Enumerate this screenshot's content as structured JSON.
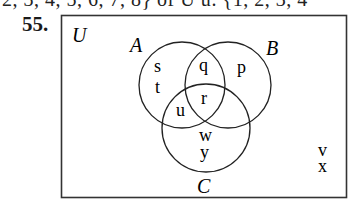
{
  "header": {
    "cropped_line": "2, 3, 4, 5, 6, 7, 8} of U        u: {1, 2, 3, 4",
    "problem_number": "55."
  },
  "diagram": {
    "universe_label": "U",
    "sets": [
      {
        "name": "A",
        "label": "A"
      },
      {
        "name": "B",
        "label": "B"
      },
      {
        "name": "C",
        "label": "C"
      }
    ],
    "regions": {
      "A_only": [
        "s",
        "t"
      ],
      "A_and_B_only": [
        "q"
      ],
      "B_only": [
        "p"
      ],
      "A_and_B_and_C": [
        "r"
      ],
      "A_and_C_only": [
        "u"
      ],
      "C_only": [
        "w",
        "y"
      ],
      "outside": [
        "v",
        "x"
      ]
    },
    "elements": {
      "s": "s",
      "t": "t",
      "q": "q",
      "p": "p",
      "r": "r",
      "u": "u",
      "w": "w",
      "y": "y",
      "v": "v",
      "x": "x"
    }
  }
}
